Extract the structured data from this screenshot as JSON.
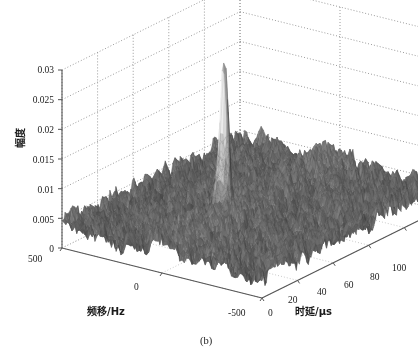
{
  "figure": {
    "caption": "(b)",
    "background_color": "#ffffff",
    "surface_color": "#3a3a3a",
    "surface_edge_color": "#2b2b2b",
    "grid_color": "#9a9a9a",
    "axis_color": "#555555",
    "peak_color": "#8a8a8a"
  },
  "chart_data": {
    "type": "surface",
    "title": "",
    "subtitle": "",
    "annotations": [
      "(b)"
    ],
    "xlabel": "时延/μs",
    "ylabel": "频移/Hz",
    "zlabel": "幅度",
    "xlim": [
      0,
      100
    ],
    "ylim": [
      -500,
      500
    ],
    "zlim": [
      0,
      0.03
    ],
    "xticks": [
      0,
      20,
      40,
      60,
      80,
      100
    ],
    "yticks": [
      500,
      0,
      -500
    ],
    "zticks": [
      0,
      0.005,
      0.01,
      0.015,
      0.02,
      0.025,
      0.03
    ],
    "xtick_labels": [
      "0",
      "20",
      "40",
      "60",
      "80",
      "100"
    ],
    "ytick_labels": [
      "500",
      "0",
      "-500"
    ],
    "ztick_labels": [
      "0",
      "0.005",
      "0.01",
      "0.015",
      "0.02",
      "0.025",
      "0.03"
    ],
    "grid": true,
    "legend": "none",
    "noise_floor_level": 0.004,
    "noise_floor_range": [
      0.001,
      0.007
    ],
    "peak": {
      "x_delay_us": 35,
      "y_doppler_hz": 0,
      "z_amplitude": 0.026,
      "shape": "thumbtack"
    },
    "view": {
      "azimuth_deg": -37.5,
      "elevation_deg": 30
    }
  },
  "axis_titles": {
    "x": "时延/μs",
    "y": "频移/Hz",
    "z": "幅度"
  },
  "z_ticks": [
    {
      "label": "0.03"
    },
    {
      "label": "0.025"
    },
    {
      "label": "0.02"
    },
    {
      "label": "0.015"
    },
    {
      "label": "0.01"
    },
    {
      "label": "0.005"
    },
    {
      "label": "0"
    }
  ],
  "y_ticks": [
    {
      "label": "500"
    },
    {
      "label": "0"
    },
    {
      "label": "-500"
    }
  ],
  "x_ticks": [
    {
      "label": "0"
    },
    {
      "label": "20"
    },
    {
      "label": "40"
    },
    {
      "label": "60"
    },
    {
      "label": "80"
    },
    {
      "label": "100"
    }
  ]
}
